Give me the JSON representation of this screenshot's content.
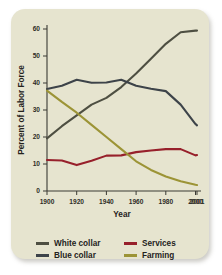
{
  "card": {
    "background_color": "#e6e4cf"
  },
  "chart_data": {
    "type": "line",
    "title": "",
    "xlabel": "Year",
    "ylabel": "Percent of Labor Force",
    "x": [
      1900,
      1910,
      1920,
      1930,
      1940,
      1950,
      1960,
      1970,
      1980,
      1990,
      2000,
      2001
    ],
    "xlim": [
      1900,
      2001
    ],
    "ylim": [
      0,
      60
    ],
    "xticks": [
      1900,
      1920,
      1940,
      1960,
      1980,
      2000,
      2001
    ],
    "xtick_labels": [
      "1900",
      "1920",
      "1940",
      "1960",
      "1980",
      "2000",
      "2001"
    ],
    "yticks": [
      0,
      10,
      20,
      30,
      40,
      50,
      60
    ],
    "ytick_labels": [
      "0",
      "10",
      "20",
      "30",
      "40",
      "50",
      "60"
    ],
    "grid": false,
    "legend_position": "below",
    "series": [
      {
        "name": "White collar",
        "color": "#4e4f42",
        "values": [
          19.5,
          24.0,
          28.0,
          32.0,
          34.5,
          38.5,
          43.5,
          49.0,
          54.5,
          58.8,
          59.4,
          59.4
        ]
      },
      {
        "name": "Blue collar",
        "color": "#3d4349",
        "values": [
          37.8,
          39.0,
          41.2,
          40.1,
          40.2,
          41.2,
          39.0,
          37.9,
          37.0,
          32.0,
          24.8,
          24.3
        ]
      },
      {
        "name": "Services",
        "color": "#97202b",
        "values": [
          11.5,
          11.3,
          9.6,
          11.2,
          13.1,
          13.2,
          14.4,
          15.0,
          15.5,
          15.5,
          13.2,
          13.3
        ]
      },
      {
        "name": "Farming",
        "color": "#9c9436",
        "values": [
          37.2,
          33.0,
          29.0,
          24.5,
          20.0,
          15.5,
          11.0,
          7.8,
          5.4,
          3.6,
          2.3,
          2.2
        ]
      }
    ]
  },
  "legend": {
    "rows": [
      [
        {
          "label": "White collar",
          "color": "#4e4f42"
        },
        {
          "label": "Services",
          "color": "#97202b"
        }
      ],
      [
        {
          "label": "Blue collar",
          "color": "#3d4349"
        },
        {
          "label": "Farming",
          "color": "#9c9436"
        }
      ]
    ]
  }
}
